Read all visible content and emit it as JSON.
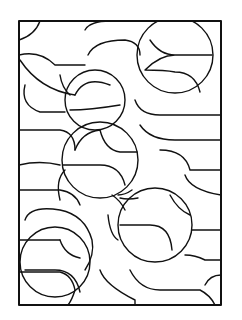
{
  "artwork": {
    "type": "coloring-page",
    "subject": "abstract overlapping circles and leaf-shaped lozenges in a rectangular frame",
    "stroke_color": "#111111",
    "background_color": "#ffffff",
    "frame": {
      "x": 19,
      "y": 21,
      "width": 202,
      "height": 284
    },
    "big_circles": [
      {
        "cx": 95,
        "cy": 100,
        "r": 30
      },
      {
        "cx": 175,
        "cy": 55,
        "r": 38
      },
      {
        "cx": 100,
        "cy": 160,
        "r": 38
      },
      {
        "cx": 155,
        "cy": 225,
        "r": 37
      },
      {
        "cx": 55,
        "cy": 255,
        "r": 35
      }
    ]
  }
}
